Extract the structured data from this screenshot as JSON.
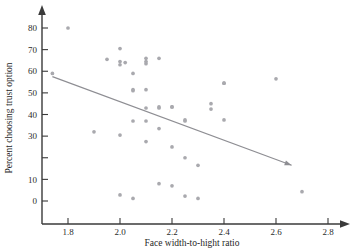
{
  "chart_data": {
    "type": "scatter",
    "title": "",
    "xlabel": "Face width-to-hight ratio",
    "ylabel": "Percent choosing trust option",
    "xlim": [
      1.7,
      2.82
    ],
    "ylim": [
      -4,
      86
    ],
    "grid": false,
    "legend": null,
    "xticks": [
      1.8,
      2.0,
      2.2,
      2.4,
      2.6,
      2.8
    ],
    "xtick_labels": [
      "1.8",
      "2.0",
      "2.2",
      "2.4",
      "2.6",
      "2.8"
    ],
    "yticks": [
      0,
      10,
      20,
      30,
      40,
      50,
      60,
      70,
      80
    ],
    "ytick_labels": [
      "0",
      "10",
      "",
      "30",
      "40",
      "50",
      "60",
      "70",
      "80"
    ],
    "x": [
      1.74,
      1.8,
      1.9,
      1.95,
      2.0,
      2.0,
      2.0,
      2.0,
      2.0,
      2.02,
      2.05,
      2.05,
      2.05,
      2.05,
      2.05,
      2.1,
      2.1,
      2.1,
      2.1,
      2.1,
      2.1,
      2.1,
      2.15,
      2.15,
      2.15,
      2.15,
      2.15,
      2.2,
      2.2,
      2.2,
      2.2,
      2.25,
      2.25,
      2.25,
      2.25,
      2.3,
      2.3,
      2.35,
      2.35,
      2.4,
      2.4,
      2.4,
      2.6,
      2.7
    ],
    "y": [
      59.0,
      80.0,
      32.0,
      65.5,
      70.5,
      64.5,
      63.0,
      30.5,
      2.8,
      64.0,
      59.0,
      51.0,
      37.0,
      1.2,
      51.5,
      66.0,
      64.5,
      63.5,
      51.5,
      37.0,
      27.5,
      43.0,
      66.0,
      43.5,
      33.5,
      8.0,
      43.0,
      43.5,
      25.0,
      7.0,
      43.5,
      37.0,
      20.0,
      2.3,
      37.5,
      16.5,
      1.2,
      45.0,
      42.5,
      54.5,
      37.5,
      54.5,
      56.5,
      4.3
    ],
    "n_points": 44,
    "trend_line": {
      "style": "solid-with-arrow",
      "x_start": 1.74,
      "y_start": 57.5,
      "x_end": 2.66,
      "y_end": 16.5,
      "slope": -44.6,
      "intercept": 135.1,
      "direction": "negative"
    }
  },
  "axes": {
    "x_axis_name": "x-axis",
    "y_axis_name": "y-axis",
    "x_arrow": "right-arrow",
    "y_arrow": "up-arrow"
  }
}
